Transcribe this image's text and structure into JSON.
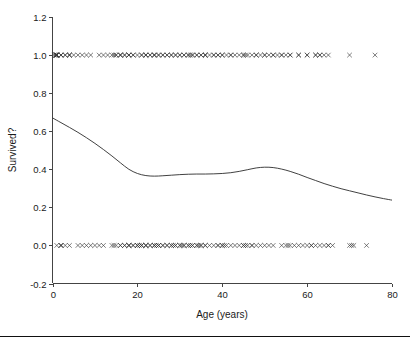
{
  "figure": {
    "width": 410,
    "height": 346,
    "background": "#ffffff",
    "bottom_rule_color": "#111111",
    "axis_color": "#444444",
    "curve_color": "#2b2b2b",
    "marker_color": "#3a3a3a"
  },
  "chart_data": {
    "type": "scatter",
    "title": "",
    "subtitle": "",
    "xlabel": "Age (years)",
    "ylabel": "Survived?",
    "xlim": [
      0,
      80
    ],
    "ylim": [
      -0.2,
      1.2
    ],
    "xticks": [
      0,
      20,
      40,
      60,
      80
    ],
    "xtick_labels": [
      "0",
      "20",
      "40",
      "60",
      "80"
    ],
    "yticks": [
      -0.2,
      0.0,
      0.2,
      0.4,
      0.6,
      0.8,
      1.0,
      1.2
    ],
    "ytick_labels": [
      "-0.2",
      "0.0",
      "0.2",
      "0.4",
      "0.6",
      "0.8",
      "1.0",
      "1.2"
    ],
    "grid": false,
    "legend": null,
    "annotations": [],
    "marker_symbol": "x",
    "series": [
      {
        "name": "Survived (y = 1)",
        "type": "scatter",
        "y_value": 1.0,
        "marker": "x",
        "x": [
          0.4,
          0.7,
          0.8,
          0.8,
          0.9,
          1.0,
          1.0,
          1.0,
          1.0,
          1.0,
          2.0,
          2.0,
          2.0,
          3.0,
          3.0,
          4.0,
          4.0,
          4.0,
          5.0,
          6.0,
          7.0,
          8.0,
          9.0,
          11.0,
          12.0,
          13.0,
          14.0,
          14.5,
          15.0,
          15.0,
          16.0,
          16.0,
          16.0,
          17.0,
          17.0,
          18.0,
          18.0,
          18.0,
          19.0,
          19.0,
          20.0,
          21.0,
          21.0,
          22.0,
          22.0,
          22.0,
          23.0,
          23.0,
          24.0,
          24.0,
          24.0,
          25.0,
          25.0,
          26.0,
          26.0,
          27.0,
          27.0,
          28.0,
          28.0,
          29.0,
          29.0,
          30.0,
          30.0,
          31.0,
          31.0,
          32.0,
          32.0,
          32.5,
          33.0,
          33.0,
          34.0,
          34.0,
          35.0,
          35.0,
          36.0,
          36.0,
          36.0,
          37.0,
          38.0,
          38.0,
          39.0,
          39.0,
          40.0,
          40.0,
          41.0,
          42.0,
          42.0,
          43.0,
          44.0,
          45.0,
          45.0,
          45.5,
          46.0,
          47.0,
          48.0,
          48.0,
          49.0,
          50.0,
          50.0,
          51.0,
          52.0,
          52.0,
          53.0,
          54.0,
          54.0,
          55.0,
          56.0,
          56.0,
          58.0,
          58.0,
          60.0,
          60.0,
          62.0,
          62.0,
          63.0,
          63.0,
          64.0,
          65.0,
          70.0,
          76.0
        ],
        "note": "Dense cluster of infants near age 0; gap between ~9 and ~13; sparse beyond 65 with isolated points near 70 and 76"
      },
      {
        "name": "Did not survive (y = 0)",
        "type": "scatter",
        "y_value": 0.0,
        "marker": "x",
        "x": [
          1.0,
          2.0,
          2.0,
          2.0,
          3.0,
          4.0,
          6.0,
          7.0,
          8.0,
          9.0,
          10.0,
          11.0,
          12.0,
          14.0,
          14.5,
          15.0,
          16.0,
          16.0,
          17.0,
          17.0,
          18.0,
          18.0,
          18.0,
          19.0,
          19.0,
          20.0,
          20.0,
          20.0,
          20.5,
          21.0,
          21.0,
          21.0,
          22.0,
          22.0,
          22.0,
          23.0,
          23.0,
          24.0,
          24.0,
          24.0,
          24.5,
          25.0,
          25.0,
          25.0,
          26.0,
          26.0,
          27.0,
          27.0,
          28.0,
          28.0,
          28.5,
          29.0,
          29.0,
          30.0,
          30.0,
          30.5,
          31.0,
          31.0,
          32.0,
          32.0,
          32.5,
          33.0,
          33.0,
          34.0,
          34.0,
          34.5,
          35.0,
          35.0,
          36.0,
          36.0,
          37.0,
          38.0,
          39.0,
          39.0,
          40.0,
          40.0,
          40.5,
          41.0,
          42.0,
          43.0,
          44.0,
          45.0,
          45.0,
          45.5,
          46.0,
          47.0,
          47.0,
          48.0,
          49.0,
          50.0,
          51.0,
          52.0,
          54.0,
          55.0,
          55.5,
          56.0,
          57.0,
          58.0,
          59.0,
          60.0,
          61.0,
          61.0,
          62.0,
          63.0,
          64.0,
          65.0,
          65.0,
          66.0,
          70.0,
          70.5,
          71.0,
          74.0
        ],
        "note": "Dense across the 18-50 band; isolated points near 70-71 and 74"
      },
      {
        "name": "Smoothed probability of survival",
        "type": "line",
        "x": [
          0,
          2,
          4,
          6,
          8,
          10,
          12,
          14,
          16,
          18,
          20,
          22,
          24,
          26,
          28,
          30,
          32,
          34,
          36,
          38,
          40,
          42,
          44,
          46,
          48,
          50,
          52,
          54,
          56,
          58,
          60,
          62,
          64,
          66,
          68,
          70,
          72,
          74,
          76,
          78,
          80
        ],
        "y": [
          0.67,
          0.645,
          0.62,
          0.594,
          0.566,
          0.536,
          0.504,
          0.47,
          0.434,
          0.4,
          0.378,
          0.367,
          0.364,
          0.366,
          0.369,
          0.372,
          0.374,
          0.375,
          0.375,
          0.376,
          0.378,
          0.382,
          0.389,
          0.398,
          0.407,
          0.411,
          0.409,
          0.401,
          0.389,
          0.374,
          0.357,
          0.341,
          0.325,
          0.311,
          0.298,
          0.287,
          0.276,
          0.265,
          0.255,
          0.246,
          0.238
        ]
      }
    ]
  }
}
